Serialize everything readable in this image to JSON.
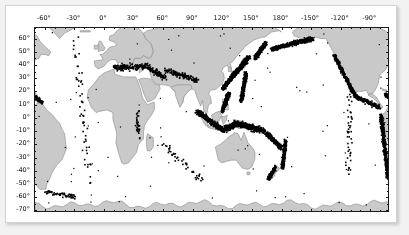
{
  "figure": {
    "kind": "global-seismicity-map",
    "background_color": "#ffffff",
    "frame_color": "#d3d3d3",
    "axis_color": "#1a1a1a"
  },
  "chart_data": {
    "type": "scatter",
    "title": "",
    "subtitle": "",
    "xlabel": "",
    "ylabel": "",
    "projection": "equirectangular",
    "grid": false,
    "legend": null,
    "xlim": [
      -70,
      290
    ],
    "ylim": [
      -72,
      68
    ],
    "x_tick_labels": [
      "-60°",
      "-30°",
      "0°",
      "30°",
      "60°",
      "90°",
      "120°",
      "150°",
      "180°",
      "-150°",
      "-120°",
      "-90°",
      "-60°"
    ],
    "x_tick_values": [
      -60,
      -30,
      0,
      30,
      60,
      90,
      120,
      150,
      180,
      210,
      240,
      270,
      300
    ],
    "x_minor_step": 10,
    "y_tick_labels": [
      "60°",
      "50°",
      "40°",
      "30°",
      "20°",
      "10°",
      "0°",
      "-10°",
      "-20°",
      "-30°",
      "-40°",
      "-50°",
      "-60°",
      "-70°"
    ],
    "y_tick_values": [
      60,
      50,
      40,
      30,
      20,
      10,
      0,
      -10,
      -20,
      -30,
      -40,
      -50,
      -60,
      -70
    ],
    "y_minor_step": 5,
    "land_color": "#c9c9c9",
    "ocean_color": "#ffffff",
    "coastline_color": "#8a8a8a",
    "marker_color": "#000000",
    "marker_size_px": 1.6,
    "marker_label": "earthquake epicenter",
    "series": [
      {
        "name": "epicenters",
        "description": "Dense black epicenter clusters tracing the circum-Pacific Ring of Fire plus the Alpine-Himalayan belt.",
        "clusters": [
          {
            "name": "Aleutian-Alaska arc",
            "lon0": 170,
            "lat0": 52,
            "lon1": 212,
            "lat1": 60,
            "n": 420,
            "spread": 1.6
          },
          {
            "name": "Kamchatka-Kuril",
            "lon0": 153,
            "lat0": 45,
            "lon1": 164,
            "lat1": 57,
            "n": 300,
            "spread": 1.6
          },
          {
            "name": "Japan trench",
            "lon0": 130,
            "lat0": 31,
            "lon1": 147,
            "lat1": 46,
            "n": 420,
            "spread": 1.8
          },
          {
            "name": "Ryukyu-Taiwan",
            "lon0": 121,
            "lat0": 22,
            "lon1": 131,
            "lat1": 32,
            "n": 230,
            "spread": 1.5
          },
          {
            "name": "Izu-Bonin-Mariana",
            "lon0": 139,
            "lat0": 12,
            "lon1": 144,
            "lat1": 34,
            "n": 300,
            "spread": 1.5
          },
          {
            "name": "Philippines",
            "lon0": 120,
            "lat0": 5,
            "lon1": 127,
            "lat1": 19,
            "n": 300,
            "spread": 1.6
          },
          {
            "name": "Sunda arc (Sumatra-Java)",
            "lon0": 94,
            "lat0": 5,
            "lon1": 122,
            "lat1": -10,
            "n": 420,
            "spread": 1.8
          },
          {
            "name": "Banda-Timor",
            "lon0": 122,
            "lat0": -9,
            "lon1": 133,
            "lat1": -5,
            "n": 220,
            "spread": 2.0
          },
          {
            "name": "New Guinea-Solomon",
            "lon0": 132,
            "lat0": -4,
            "lon1": 163,
            "lat1": -10,
            "n": 330,
            "spread": 2.0
          },
          {
            "name": "Vanuatu-Fiji",
            "lon0": 165,
            "lat0": -12,
            "lon1": 179,
            "lat1": -22,
            "n": 260,
            "spread": 1.8
          },
          {
            "name": "Tonga-Kermadec",
            "lon0": 184,
            "lat0": -17,
            "lon1": 181,
            "lat1": -38,
            "n": 300,
            "spread": 1.5
          },
          {
            "name": "New Zealand",
            "lon0": 174,
            "lat0": -37,
            "lon1": 167,
            "lat1": -46,
            "n": 170,
            "spread": 1.4
          },
          {
            "name": "Cascadia-Mexico",
            "lon0": 233,
            "lat0": 48,
            "lon1": 255,
            "lat1": 16,
            "n": 260,
            "spread": 1.6
          },
          {
            "name": "Central America",
            "lon0": 255,
            "lat0": 16,
            "lon1": 279,
            "lat1": 8,
            "n": 200,
            "spread": 1.5
          },
          {
            "name": "Andes (Peru-Chile)",
            "lon0": 281,
            "lat0": 2,
            "lon1": 288,
            "lat1": -45,
            "n": 420,
            "spread": 1.8
          },
          {
            "name": "Caribbean arc",
            "lon0": 285,
            "lat0": 18,
            "lon1": 298,
            "lat1": 11,
            "n": 120,
            "spread": 1.6
          },
          {
            "name": "Scotia arc",
            "lon0": 300,
            "lat0": -56,
            "lon1": 330,
            "lat1": -60,
            "n": 60,
            "spread": 1.6
          },
          {
            "name": "Alpine-Mediterranean belt",
            "lon0": 10,
            "lat0": 38,
            "lon1": 45,
            "lat1": 39,
            "n": 150,
            "spread": 2.2
          },
          {
            "name": "Himalaya-Hindu Kush",
            "lon0": 62,
            "lat0": 36,
            "lon1": 96,
            "lat1": 28,
            "n": 130,
            "spread": 2.0
          },
          {
            "name": "Iran-Caucasus",
            "lon0": 45,
            "lat0": 38,
            "lon1": 62,
            "lat1": 30,
            "n": 90,
            "spread": 2.2
          },
          {
            "name": "Mid-Atlantic ridge",
            "lon0": -30,
            "lat0": 60,
            "lon1": -14,
            "lat1": -50,
            "n": 55,
            "spread": 3.5
          },
          {
            "name": "East Pacific Rise",
            "lon0": 249,
            "lat0": 20,
            "lon1": 248,
            "lat1": -45,
            "n": 45,
            "spread": 4.0
          },
          {
            "name": "Indian Ocean ridge",
            "lon0": 60,
            "lat0": -20,
            "lon1": 100,
            "lat1": -48,
            "n": 45,
            "spread": 3.5
          },
          {
            "name": "East African rift",
            "lon0": 33,
            "lat0": 8,
            "lon1": 36,
            "lat1": -15,
            "n": 30,
            "spread": 2.5
          }
        ]
      }
    ]
  }
}
